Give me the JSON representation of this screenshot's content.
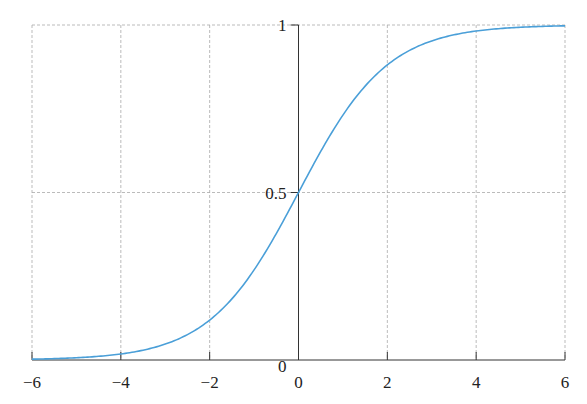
{
  "chart_data": {
    "type": "line",
    "title": "",
    "xlabel": "",
    "ylabel": "",
    "xlim": [
      -6,
      6
    ],
    "ylim": [
      0,
      1
    ],
    "grid": true,
    "x_ticks": [
      "−6",
      "−4",
      "−2",
      "0",
      "2",
      "4",
      "6"
    ],
    "y_ticks": [
      "0",
      "0.5",
      "1"
    ],
    "series": [
      {
        "name": "sigmoid",
        "color": "#4a9fd8",
        "function": "1/(1+exp(-x))",
        "x": [
          -6,
          -5,
          -4,
          -3,
          -2,
          -1,
          0,
          1,
          2,
          3,
          4,
          5,
          6
        ],
        "y": [
          0.0025,
          0.0067,
          0.018,
          0.047,
          0.119,
          0.269,
          0.5,
          0.731,
          0.881,
          0.953,
          0.982,
          0.993,
          0.9975
        ]
      }
    ]
  }
}
